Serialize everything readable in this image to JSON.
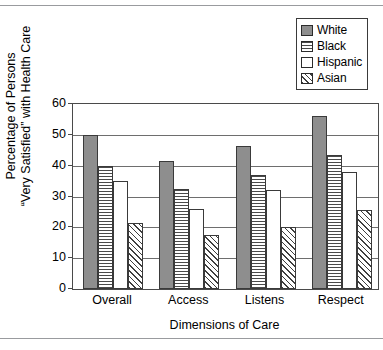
{
  "chart_data": {
    "type": "bar",
    "title": "",
    "xlabel": "Dimensions of Care",
    "ylabel_line1": "Percentage of Persons",
    "ylabel_line2": "“Very Satisfied” with Health Care",
    "categories": [
      "Overall",
      "Access",
      "Listens",
      "Respect"
    ],
    "series": [
      {
        "name": "White",
        "values": [
          50.0,
          41.5,
          46.5,
          56.0
        ],
        "pattern": "solid-gray",
        "color": "#8e8e8e"
      },
      {
        "name": "Black",
        "values": [
          40.0,
          32.5,
          37.0,
          43.5
        ],
        "pattern": "horizontal-lines",
        "color": "#4a4a4a"
      },
      {
        "name": "Hispanic",
        "values": [
          35.0,
          26.0,
          32.0,
          38.0
        ],
        "pattern": "none",
        "color": "#ffffff"
      },
      {
        "name": "Asian",
        "values": [
          21.5,
          17.5,
          20.0,
          25.5
        ],
        "pattern": "diagonal-hatch",
        "color": "#3f3f3f"
      }
    ],
    "ylim": [
      0,
      60
    ],
    "yticks": [
      0,
      10,
      20,
      30,
      40,
      50,
      60
    ],
    "ytick_labels": [
      "0",
      "10",
      "20",
      "30",
      "40",
      "50",
      "60"
    ],
    "grid": "horizontal",
    "legend_position": "top-right"
  },
  "legend": {
    "entries": [
      {
        "label": "White"
      },
      {
        "label": "Black"
      },
      {
        "label": "Hispanic"
      },
      {
        "label": "Asian"
      }
    ]
  }
}
